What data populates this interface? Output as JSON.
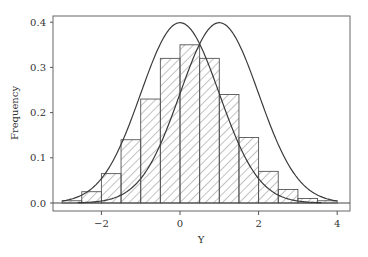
{
  "chart_data": {
    "type": "bar",
    "subtype": "histogram-with-density-curves",
    "title": "",
    "xlabel": "Y",
    "ylabel": "Frequency",
    "xlim": [
      -3.2,
      4.3
    ],
    "ylim": [
      -0.02,
      0.415
    ],
    "x_ticks": [
      -2,
      0,
      2,
      4
    ],
    "x_tick_labels": [
      "−2",
      "0",
      "2",
      "4"
    ],
    "y_ticks": [
      0.0,
      0.1,
      0.2,
      0.3,
      0.4
    ],
    "y_tick_labels": [
      "0.0",
      "0.1",
      "0.2",
      "0.3",
      "0.4"
    ],
    "grid": false,
    "legend": null,
    "bin_width": 0.5,
    "bins": [
      {
        "left": -3.0,
        "right": -2.5,
        "height": 0.005
      },
      {
        "left": -2.5,
        "right": -2.0,
        "height": 0.025
      },
      {
        "left": -2.0,
        "right": -1.5,
        "height": 0.065
      },
      {
        "left": -1.5,
        "right": -1.0,
        "height": 0.14
      },
      {
        "left": -1.0,
        "right": -0.5,
        "height": 0.23
      },
      {
        "left": -0.5,
        "right": 0.0,
        "height": 0.32
      },
      {
        "left": 0.0,
        "right": 0.5,
        "height": 0.35
      },
      {
        "left": 0.5,
        "right": 1.0,
        "height": 0.32
      },
      {
        "left": 1.0,
        "right": 1.5,
        "height": 0.24
      },
      {
        "left": 1.5,
        "right": 2.0,
        "height": 0.145
      },
      {
        "left": 2.0,
        "right": 2.5,
        "height": 0.07
      },
      {
        "left": 2.5,
        "right": 3.0,
        "height": 0.03
      },
      {
        "left": 3.0,
        "right": 3.5,
        "height": 0.01
      },
      {
        "left": 3.5,
        "right": 4.0,
        "height": 0.005
      }
    ],
    "series": [
      {
        "name": "Normal density (mean 0, sd 1)",
        "type": "line",
        "mean": 0,
        "sd": 1,
        "x_range": [
          -3.0,
          3.6
        ]
      },
      {
        "name": "Normal density (mean 1, sd 1)",
        "type": "line",
        "mean": 1,
        "sd": 1,
        "x_range": [
          -2.6,
          4.0
        ]
      }
    ],
    "bar_fill": "diagonal-hatch",
    "colors": {
      "line": "#3a3a3a",
      "hatch": "#555555",
      "frame": "#555555"
    }
  }
}
